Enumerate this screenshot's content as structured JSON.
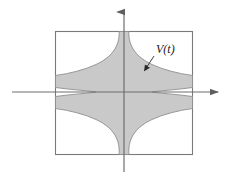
{
  "figure": {
    "title": "",
    "label": {
      "text": "V(t)",
      "x": 156,
      "y": 53
    },
    "colors": {
      "region_fill": "#c9c9c9",
      "region_stroke": "#8a8a8a",
      "axis": "#6e6e6e",
      "rect_stroke": "#7a7a7a",
      "background": "#ffffff",
      "label_color": "#1a1a1a",
      "arrow_color": "#2a2a2a"
    },
    "rectangle": {
      "x": 55,
      "y": 31,
      "width": 138,
      "height": 124
    },
    "axes": {
      "origin_x": 124,
      "origin_y": 92,
      "vertical": {
        "x": 124,
        "y_top": 8,
        "y_bottom": 172,
        "arrow": "up"
      },
      "horizontal": {
        "y": 92,
        "x_left": 12,
        "x_right": 222,
        "arrow": "right"
      }
    },
    "region": {
      "shape": "hyperbolic-cross",
      "description": "region bounded by four hyperbola branches xy = const",
      "half_width_at_rect_edge": 5,
      "half_height_at_rect_edge": 5,
      "constant": 620
    },
    "pointer": {
      "from_x": 154,
      "from_y": 56,
      "to_x": 143,
      "to_y": 72
    }
  }
}
